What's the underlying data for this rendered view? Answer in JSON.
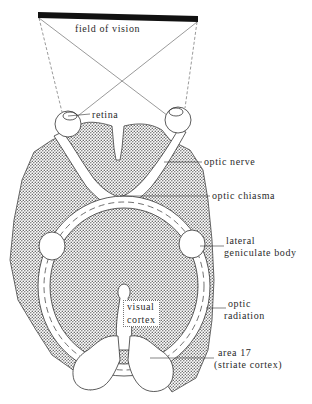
{
  "figure": {
    "labels": {
      "field_of_vision": "field of vision",
      "retina": "retina",
      "optic_nerve": "optic nerve",
      "optic_chiasma": "optic chiasma",
      "lateral_geniculate_body_line1": "lateral",
      "lateral_geniculate_body_line2": "geniculate body",
      "optic_radiation_line1": "optic",
      "optic_radiation_line2": "radiation",
      "visual_cortex_line1": "visual",
      "visual_cortex_line2": "cortex",
      "area17_line1": "area 17",
      "area17_line2": "(striate cortex)"
    },
    "caption": "Fig. 1.5  The visual pathways ..."
  },
  "colors": {
    "ink": "#2a2a2a",
    "stipple": "#8a8a8a",
    "background": "#ffffff"
  }
}
